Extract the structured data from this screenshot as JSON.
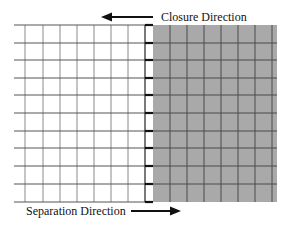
{
  "diagram": {
    "labels": {
      "closure": "Closure Direction",
      "separation": "Separation Direction"
    },
    "arrows": {
      "closure": "left",
      "separation": "right"
    },
    "grid": {
      "rows": 10,
      "white_columns": 8,
      "gray_columns": 7,
      "interface_strip": true
    },
    "colors": {
      "white_region": "#ffffff",
      "white_grid_line": "#8a8a8a",
      "gray_region": "#a9a9a9",
      "gray_grid_line": "#4a4a4a",
      "interface_line": "#111111",
      "arrow": "#111111",
      "text": "#111111"
    }
  }
}
